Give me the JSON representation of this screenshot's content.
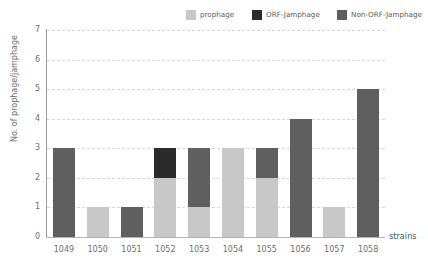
{
  "chart_data": {
    "type": "bar",
    "stacked": true,
    "title": "",
    "xlabel": "strains",
    "ylabel": "No. of prophage/jamphage",
    "categories": [
      "1049",
      "1050",
      "1051",
      "1052",
      "1053",
      "1054",
      "1055",
      "1056",
      "1057",
      "1058"
    ],
    "yticks": [
      0,
      1,
      2,
      3,
      4,
      5,
      6,
      7
    ],
    "ylim": [
      0,
      7
    ],
    "grid": "horizontal-dashed",
    "legend_position": "top",
    "series": [
      {
        "name": "prophage",
        "color": "#c8c8c8",
        "values": [
          0,
          1,
          0,
          2,
          1,
          3,
          2,
          0,
          1,
          0
        ]
      },
      {
        "name": "ORF-Jamphage",
        "color": "#2b2b2b",
        "values": [
          0,
          0,
          0,
          1,
          0,
          0,
          0,
          0,
          0,
          0
        ]
      },
      {
        "name": "Non-ORF-Jamphage",
        "color": "#5f5f5f",
        "values": [
          3,
          0,
          1,
          0,
          2,
          0,
          1,
          4,
          0,
          5
        ]
      }
    ],
    "totals": [
      3,
      1,
      1,
      3,
      3,
      3,
      3,
      4,
      1,
      5
    ]
  },
  "colors": {
    "prophage": "#c8c8c8",
    "orf_jamphage": "#2b2b2b",
    "non_orf_jamphage": "#5f5f5f",
    "gridline": "#d8d8dc",
    "axis": "#9a9a9a",
    "text": "#6e6e6e",
    "background": "#ffffff"
  }
}
